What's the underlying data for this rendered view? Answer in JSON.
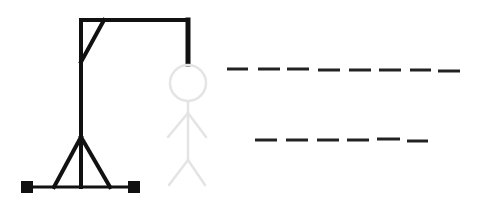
{
  "game": {
    "name": "Hangman",
    "colors": {
      "gallows": "#111111",
      "figure": "#e4e4e4",
      "blanks": "#222222",
      "background": "#ffffff"
    },
    "figure_parts_visible": [
      "head",
      "body",
      "left-arm",
      "right-arm",
      "left-leg",
      "right-leg"
    ],
    "figure_style": "faded",
    "word_lines": [
      {
        "letters": 8,
        "revealed": [
          "",
          "",
          "",
          "",
          "",
          "",
          "",
          ""
        ]
      },
      {
        "letters": 6,
        "revealed": [
          "",
          "",
          "",
          "",
          "",
          ""
        ]
      }
    ]
  }
}
